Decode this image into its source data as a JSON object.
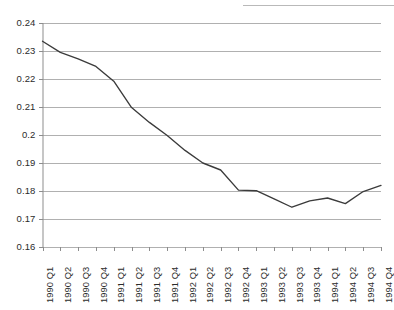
{
  "chart_data": {
    "type": "line",
    "title": "",
    "subtitle": "",
    "xlabel": "",
    "ylabel": "",
    "categories": [
      "1990 Q1",
      "1990 Q2",
      "1990 Q3",
      "1990 Q4",
      "1991 Q1",
      "1991 Q2",
      "1991 Q3",
      "1991 Q4",
      "1992 Q1",
      "1992 Q2",
      "1992 Q3",
      "1992 Q4",
      "1993 Q1",
      "1993 Q2",
      "1993 Q3",
      "1993 Q4",
      "1994 Q1",
      "1994 Q2",
      "1994 Q3",
      "1994 Q4"
    ],
    "values": [
      0.2335,
      0.2295,
      0.2272,
      0.2245,
      0.2192,
      0.2098,
      0.2045,
      0.1998,
      0.1945,
      0.19,
      0.1875,
      0.1803,
      0.1801,
      0.1772,
      0.1742,
      0.1765,
      0.1775,
      0.1755,
      0.1798,
      0.182
    ],
    "ylim": [
      0.16,
      0.24
    ],
    "yticks": [
      0.16,
      0.17,
      0.18,
      0.19,
      0.2,
      0.21,
      0.22,
      0.23,
      0.24
    ],
    "ytick_labels": [
      "0.16",
      "0.17",
      "0.18",
      "0.19",
      "0.2",
      "0.21",
      "0.22",
      "0.23",
      "0.24"
    ],
    "grid": "horizontal",
    "legend": "none",
    "series_name": "",
    "line_color": "#3b3b3b",
    "grid_color": "#b0b0b0",
    "axis_color": "#8d8d8d",
    "text_color": "#2b2b2b"
  }
}
